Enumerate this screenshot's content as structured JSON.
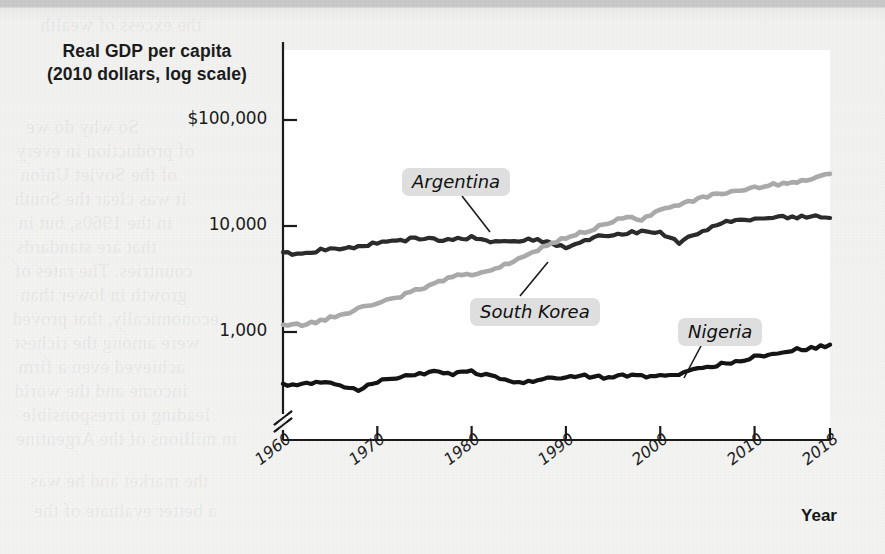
{
  "figure": {
    "y_axis_title_line1": "Real GDP per capita",
    "y_axis_title_line2": "(2010 dollars, log scale)",
    "x_axis_title": "Year"
  },
  "chart_data": {
    "type": "line",
    "title": "Real GDP per capita (2010 dollars, log scale)",
    "xlabel": "Year",
    "ylabel": "Real GDP per capita (2010 dollars, log scale)",
    "y_scale": "log",
    "y_axis_break": true,
    "grid": false,
    "legend_position": "inline-callout",
    "xlim": [
      1960,
      2018
    ],
    "ylim": [
      300,
      100000
    ],
    "xticks": [
      1960,
      1970,
      1980,
      1990,
      2000,
      2010,
      2018
    ],
    "xtick_labels": [
      "1960",
      "1970",
      "1980",
      "1990",
      "2000",
      "2010",
      "2018"
    ],
    "yticks": [
      1000,
      10000,
      100000
    ],
    "ytick_labels": [
      "1,000",
      "10,000",
      "$100,000"
    ],
    "series": [
      {
        "name": "Argentina",
        "color": "#2b2b2b",
        "label_position": {
          "x": 402,
          "y": 168
        },
        "x": [
          1960,
          1962,
          1964,
          1966,
          1968,
          1970,
          1972,
          1974,
          1976,
          1978,
          1980,
          1982,
          1984,
          1986,
          1988,
          1990,
          1992,
          1994,
          1996,
          1998,
          2000,
          2002,
          2004,
          2006,
          2008,
          2010,
          2012,
          2014,
          2016,
          2018
        ],
        "values": [
          5550,
          5450,
          5950,
          6050,
          6400,
          6950,
          7100,
          7700,
          7450,
          7400,
          7800,
          7150,
          7150,
          7500,
          7100,
          6200,
          7350,
          8100,
          8300,
          9000,
          8600,
          7000,
          8600,
          10200,
          11500,
          11600,
          12100,
          12000,
          12300,
          11900
        ]
      },
      {
        "name": "South Korea",
        "color": "#a9a9a9",
        "label_position": {
          "x": 470,
          "y": 298
        },
        "x": [
          1960,
          1962,
          1964,
          1966,
          1968,
          1970,
          1972,
          1974,
          1976,
          1978,
          1980,
          1982,
          1984,
          1986,
          1988,
          1990,
          1992,
          1994,
          1996,
          1998,
          2000,
          2002,
          2004,
          2006,
          2008,
          2010,
          2012,
          2014,
          2016,
          2018
        ],
        "values": [
          1150,
          1180,
          1280,
          1450,
          1650,
          1900,
          2100,
          2450,
          2800,
          3350,
          3450,
          3900,
          4500,
          5300,
          6600,
          7700,
          8800,
          10200,
          12000,
          11500,
          14000,
          16000,
          17800,
          20000,
          21500,
          23000,
          24500,
          26000,
          28000,
          31000
        ]
      },
      {
        "name": "Nigeria",
        "color": "#141414",
        "label_position": {
          "x": 678,
          "y": 318
        },
        "x": [
          1960,
          1962,
          1964,
          1966,
          1968,
          1970,
          1972,
          1974,
          1976,
          1978,
          1980,
          1982,
          1984,
          1986,
          1988,
          1990,
          1992,
          1994,
          1996,
          1998,
          2000,
          2002,
          2004,
          2006,
          2008,
          2010,
          2012,
          2014,
          2016,
          2018
        ],
        "values": [
          320,
          325,
          330,
          315,
          285,
          340,
          370,
          400,
          420,
          400,
          420,
          380,
          340,
          340,
          360,
          380,
          385,
          375,
          385,
          385,
          390,
          400,
          450,
          490,
          530,
          580,
          620,
          680,
          700,
          760
        ]
      }
    ]
  },
  "series_labels": [
    {
      "name": "Argentina"
    },
    {
      "name": "South Korea"
    },
    {
      "name": "Nigeria"
    }
  ],
  "bleed_text": [
    {
      "t": "the excess of wealth",
      "x": 40,
      "y": 14
    },
    {
      "t": "So why do we",
      "x": 26,
      "y": 116
    },
    {
      "t": "of production in every",
      "x": 16,
      "y": 140
    },
    {
      "t": "of the Soviet Union",
      "x": 20,
      "y": 164
    },
    {
      "t": "it was clear the South",
      "x": 14,
      "y": 188
    },
    {
      "t": "in the 1960s, but in",
      "x": 18,
      "y": 212
    },
    {
      "t": "that are standards",
      "x": 16,
      "y": 236
    },
    {
      "t": "countries. The rates of",
      "x": 14,
      "y": 260
    },
    {
      "t": "growth in lower than",
      "x": 20,
      "y": 284
    },
    {
      "t": "economically, that proved",
      "x": 12,
      "y": 308
    },
    {
      "t": "were among the richest",
      "x": 14,
      "y": 332
    },
    {
      "t": "achieved even a firm",
      "x": 18,
      "y": 356
    },
    {
      "t": "income and the world",
      "x": 14,
      "y": 380
    },
    {
      "t": "leading to irresponsible",
      "x": 22,
      "y": 404
    },
    {
      "t": "in millions of the Argentine",
      "x": 16,
      "y": 428
    },
    {
      "t": "the market and he was",
      "x": 30,
      "y": 470
    },
    {
      "t": "a better evaluate of the",
      "x": 34,
      "y": 500
    }
  ]
}
